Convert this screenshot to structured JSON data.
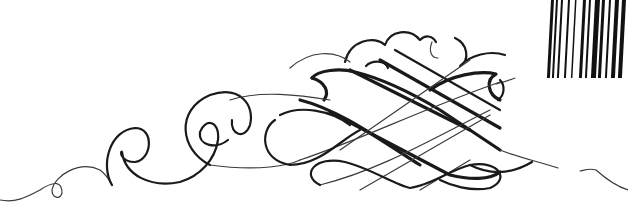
{
  "image": {
    "description": "Black calligraphic flourish ornament on white background with a partial barcode in the top-right corner",
    "background_color": "#ffffff",
    "ink_color": "#1a1a1a"
  },
  "barcode": {
    "position": "top-right",
    "bars": [
      {
        "x": 551,
        "w": 3
      },
      {
        "x": 556,
        "w": 2
      },
      {
        "x": 561,
        "w": 2
      },
      {
        "x": 568,
        "w": 2
      },
      {
        "x": 575,
        "w": 1.5
      },
      {
        "x": 583,
        "w": 3
      },
      {
        "x": 589,
        "w": 2
      },
      {
        "x": 595,
        "w": 5
      },
      {
        "x": 602,
        "w": 3
      },
      {
        "x": 609,
        "w": 2
      },
      {
        "x": 615,
        "w": 4
      },
      {
        "x": 622,
        "w": 4
      }
    ]
  }
}
